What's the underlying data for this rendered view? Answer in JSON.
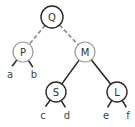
{
  "diagram": {
    "type": "binary-tree",
    "nodes": [
      {
        "id": "Q",
        "label": "Q",
        "x": 52,
        "y": 17,
        "r": 11,
        "stroke": "#2a2a2a",
        "stroke_width": 1.4
      },
      {
        "id": "P",
        "label": "P",
        "x": 23,
        "y": 52,
        "r": 10,
        "stroke": "#999999",
        "stroke_width": 1.2
      },
      {
        "id": "M",
        "label": "M",
        "x": 85,
        "y": 52,
        "r": 10,
        "stroke": "#999999",
        "stroke_width": 1.2
      },
      {
        "id": "S",
        "label": "S",
        "x": 56,
        "y": 92,
        "r": 10,
        "stroke": "#2a2a2a",
        "stroke_width": 1.4
      },
      {
        "id": "L",
        "label": "L",
        "x": 117,
        "y": 92,
        "r": 10,
        "stroke": "#2a2a2a",
        "stroke_width": 1.4
      }
    ],
    "edges": [
      {
        "from": "Q",
        "to": "P",
        "style": "dashed",
        "color": "#888888"
      },
      {
        "from": "Q",
        "to": "M",
        "style": "dashed",
        "color": "#888888"
      },
      {
        "from": "M",
        "to": "S",
        "style": "solid",
        "color": "#222222"
      },
      {
        "from": "M",
        "to": "L",
        "style": "solid",
        "color": "#222222"
      }
    ],
    "leaves": [
      {
        "parent": "P",
        "label": "a",
        "x": 10,
        "y": 78
      },
      {
        "parent": "P",
        "label": "b",
        "x": 34,
        "y": 78
      },
      {
        "parent": "S",
        "label": "c",
        "x": 43,
        "y": 119
      },
      {
        "parent": "S",
        "label": "d",
        "x": 67,
        "y": 119
      },
      {
        "parent": "L",
        "label": "e",
        "x": 106,
        "y": 119
      },
      {
        "parent": "L",
        "label": "f",
        "x": 128,
        "y": 119
      }
    ]
  }
}
